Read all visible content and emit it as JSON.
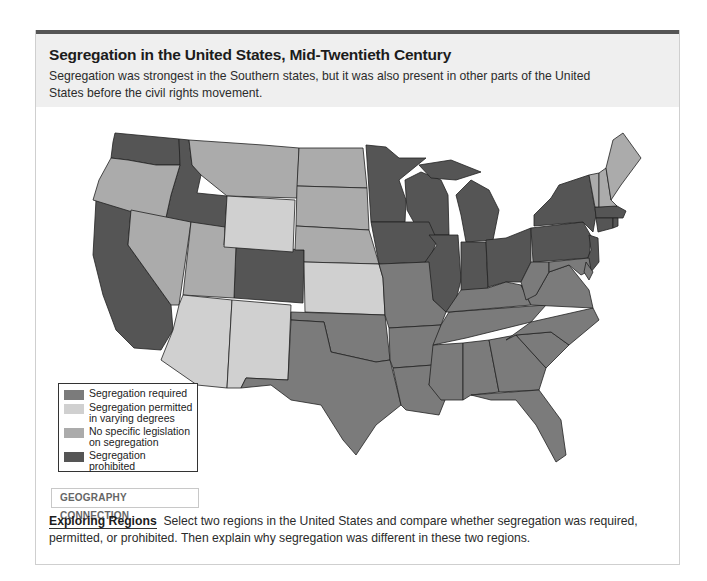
{
  "header": {
    "title": "Segregation in the United States, Mid-Twentieth Century",
    "subtitle": "Segregation was strongest in the Southern states, but it was also present in other parts of the United States before the civil rights movement."
  },
  "colors": {
    "required": "#7a7a7a",
    "permitted": "#cfcfcf",
    "no_legislation": "#ababab",
    "prohibited": "#555555",
    "border": "#222222",
    "topbar": "#555555",
    "header_bg": "#efefef"
  },
  "legend": {
    "items": [
      {
        "key": "required",
        "label": "Segregation required"
      },
      {
        "key": "permitted",
        "label": "Segregation permitted in varying degrees"
      },
      {
        "key": "no_legislation",
        "label": "No specific legislation on segregation"
      },
      {
        "key": "prohibited",
        "label": "Segregation prohibited"
      }
    ]
  },
  "map": {
    "states": {
      "required": [
        "Texas",
        "Oklahoma",
        "Missouri",
        "Arkansas",
        "Louisiana",
        "Mississippi",
        "Alabama",
        "Georgia",
        "Florida",
        "Tennessee",
        "Kentucky",
        "South Carolina",
        "North Carolina",
        "Virginia",
        "West Virginia",
        "Maryland",
        "Delaware"
      ],
      "permitted": [
        "Arizona",
        "New Mexico",
        "Wyoming",
        "Kansas"
      ],
      "no_legislation": [
        "Oregon",
        "Nevada",
        "Utah",
        "Montana",
        "North Dakota",
        "South Dakota",
        "Nebraska",
        "Maine",
        "New Hampshire",
        "Vermont"
      ],
      "prohibited": [
        "Washington",
        "California",
        "Idaho",
        "Colorado",
        "Minnesota",
        "Iowa",
        "Wisconsin",
        "Illinois",
        "Michigan",
        "Indiana",
        "Ohio",
        "Pennsylvania",
        "New York",
        "New Jersey",
        "Massachusetts",
        "Connecticut",
        "Rhode Island"
      ]
    }
  },
  "geography": {
    "label": "GEOGRAPHY CONNECTION",
    "lead": "Exploring Regions",
    "text": "Select two regions in the United States and compare whether segregation was required, permitted, or prohibited. Then explain why segregation was different in these two regions."
  }
}
